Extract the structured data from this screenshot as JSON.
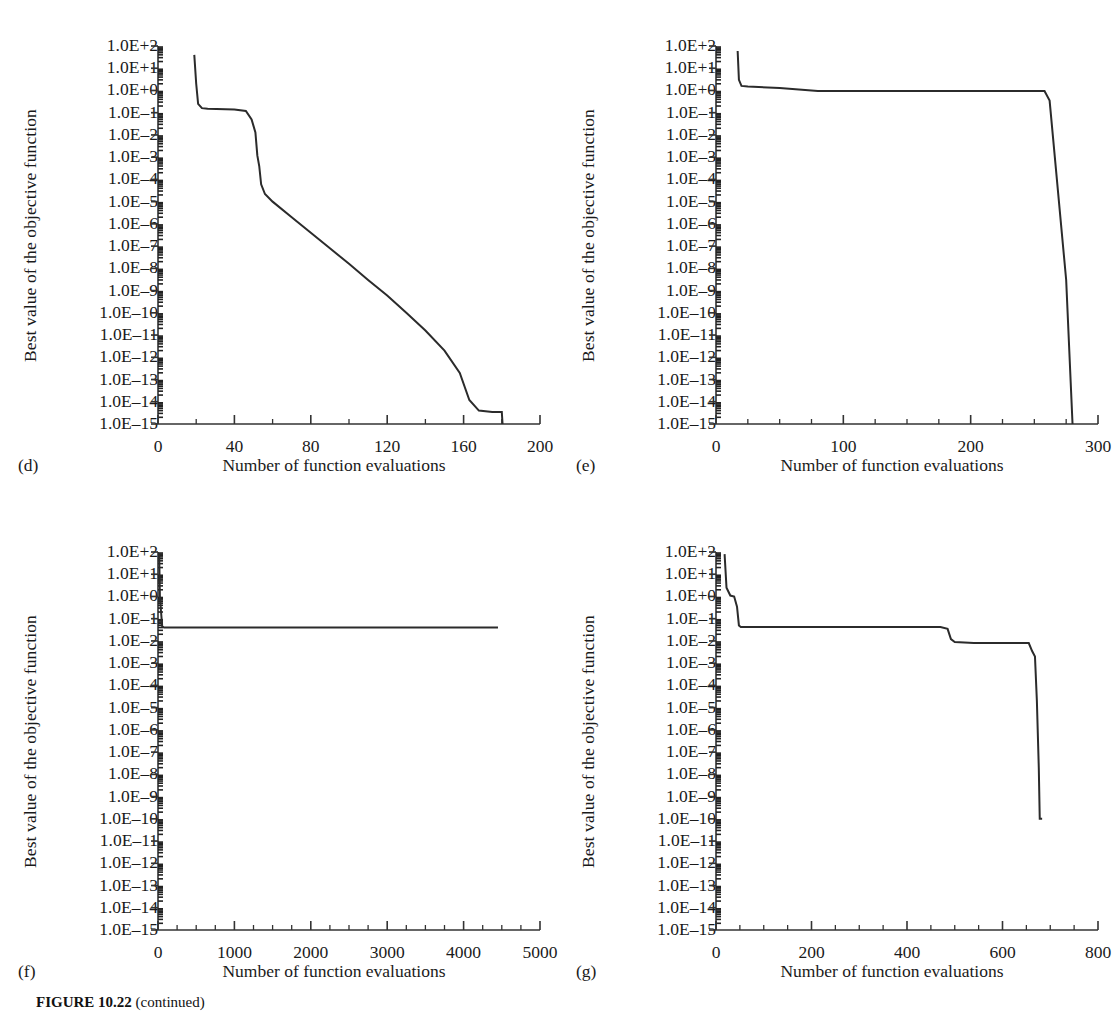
{
  "figure": {
    "caption_bold": "FIGURE 10.22",
    "caption_rest": " (continued)"
  },
  "common": {
    "ylabel": "Best value of the objective function",
    "xlabel": "Number of function evaluations",
    "ytick_labels": [
      "1.0E+2",
      "1.0E+1",
      "1.0E+0",
      "1.0E–1",
      "1.0E–2",
      "1.0E–3",
      "1.0E–4",
      "1.0E–5",
      "1.0E–6",
      "1.0E–7",
      "1.0E–8",
      "1.0E–9",
      "1.0E–10",
      "1.0E–11",
      "1.0E–12",
      "1.0E–13",
      "1.0E–14",
      "1.0E–15"
    ],
    "line_color": "#2b2b2b",
    "axis_color": "#333333"
  },
  "chart_data": [
    {
      "id": "d",
      "panel_tag": "(d)",
      "type": "line",
      "title": "",
      "xlabel": "Number of function evaluations",
      "ylabel": "Best value of the objective function",
      "yscale": "log",
      "ylim": [
        1e-15,
        100
      ],
      "ytick_values": [
        100,
        10,
        1,
        0.1,
        0.01,
        0.001,
        0.0001,
        1e-05,
        1e-06,
        1e-07,
        1e-08,
        1e-09,
        1e-10,
        1e-11,
        1e-12,
        1e-13,
        1e-14,
        1e-15
      ],
      "xlim": [
        0,
        200
      ],
      "xticks": [
        0,
        40,
        80,
        120,
        160,
        200
      ],
      "xtick_labels": [
        "0",
        "40",
        "80",
        "120",
        "160",
        "200"
      ],
      "x_minor_step": 20,
      "grid": false,
      "legend": null,
      "points": [
        [
          19,
          40
        ],
        [
          20,
          2.0
        ],
        [
          21,
          0.25
        ],
        [
          23,
          0.16
        ],
        [
          26,
          0.15
        ],
        [
          40,
          0.14
        ],
        [
          46,
          0.12
        ],
        [
          49,
          0.05
        ],
        [
          51,
          0.013
        ],
        [
          52,
          0.0012
        ],
        [
          53,
          0.0004
        ],
        [
          54,
          6e-05
        ],
        [
          56,
          2.2e-05
        ],
        [
          60,
          1e-05
        ],
        [
          70,
          2e-06
        ],
        [
          80,
          4e-07
        ],
        [
          90,
          8e-08
        ],
        [
          100,
          1.6e-08
        ],
        [
          110,
          3e-09
        ],
        [
          120,
          6e-10
        ],
        [
          130,
          1e-10
        ],
        [
          140,
          1.6e-11
        ],
        [
          150,
          2e-12
        ],
        [
          158,
          2e-13
        ],
        [
          163,
          1.2e-14
        ],
        [
          168,
          4e-15
        ],
        [
          175,
          3.5e-15
        ],
        [
          180,
          3.5e-15
        ],
        [
          180.4,
          1e-15
        ]
      ]
    },
    {
      "id": "e",
      "panel_tag": "(e)",
      "type": "line",
      "title": "",
      "xlabel": "Number of function evaluations",
      "ylabel": "Best value of the objective function",
      "yscale": "log",
      "ylim": [
        1e-15,
        100
      ],
      "ytick_values": [
        100,
        10,
        1,
        0.1,
        0.01,
        0.001,
        0.0001,
        1e-05,
        1e-06,
        1e-07,
        1e-08,
        1e-09,
        1e-10,
        1e-11,
        1e-12,
        1e-13,
        1e-14,
        1e-15
      ],
      "xlim": [
        0,
        300
      ],
      "xticks": [
        0,
        100,
        200,
        300
      ],
      "xtick_labels": [
        "0",
        "100",
        "200",
        "300"
      ],
      "x_minor_step": 25,
      "grid": false,
      "legend": null,
      "points": [
        [
          17,
          60
        ],
        [
          18,
          3.0
        ],
        [
          20,
          1.6
        ],
        [
          25,
          1.5
        ],
        [
          50,
          1.3
        ],
        [
          70,
          1.05
        ],
        [
          80,
          0.95
        ],
        [
          120,
          0.95
        ],
        [
          180,
          0.95
        ],
        [
          240,
          0.95
        ],
        [
          258,
          0.95
        ],
        [
          262,
          0.35
        ],
        [
          275,
          3e-09
        ],
        [
          280,
          1e-15
        ]
      ]
    },
    {
      "id": "f",
      "panel_tag": "(f)",
      "type": "line",
      "title": "",
      "xlabel": "Number of function evaluations",
      "ylabel": "Best value of the objective function",
      "yscale": "log",
      "ylim": [
        1e-15,
        100
      ],
      "ytick_values": [
        100,
        10,
        1,
        0.1,
        0.01,
        0.001,
        0.0001,
        1e-05,
        1e-06,
        1e-07,
        1e-08,
        1e-09,
        1e-10,
        1e-11,
        1e-12,
        1e-13,
        1e-14,
        1e-15
      ],
      "xlim": [
        0,
        5000
      ],
      "xticks": [
        0,
        1000,
        2000,
        3000,
        4000,
        5000
      ],
      "xtick_labels": [
        "0",
        "1000",
        "2000",
        "3000",
        "4000",
        "5000"
      ],
      "x_minor_step": 250,
      "grid": false,
      "legend": null,
      "points": [
        [
          15,
          90
        ],
        [
          25,
          1.0
        ],
        [
          40,
          0.2
        ],
        [
          55,
          0.045
        ],
        [
          80,
          0.04
        ],
        [
          400,
          0.04
        ],
        [
          1000,
          0.04
        ],
        [
          2000,
          0.04
        ],
        [
          3000,
          0.04
        ],
        [
          4000,
          0.04
        ],
        [
          4450,
          0.04
        ]
      ]
    },
    {
      "id": "g",
      "panel_tag": "(g)",
      "type": "line",
      "title": "",
      "xlabel": "Number of function evaluations",
      "ylabel": "Best value of the objective function",
      "yscale": "log",
      "ylim": [
        1e-15,
        100
      ],
      "ytick_values": [
        100,
        10,
        1,
        0.1,
        0.01,
        0.001,
        0.0001,
        1e-05,
        1e-06,
        1e-07,
        1e-08,
        1e-09,
        1e-10,
        1e-11,
        1e-12,
        1e-13,
        1e-14,
        1e-15
      ],
      "xlim": [
        0,
        800
      ],
      "xticks": [
        0,
        200,
        400,
        600,
        800
      ],
      "xtick_labels": [
        "0",
        "200",
        "400",
        "600",
        "800"
      ],
      "x_minor_step": 50,
      "grid": false,
      "legend": null,
      "points": [
        [
          18,
          80
        ],
        [
          22,
          2.5
        ],
        [
          30,
          1.1
        ],
        [
          38,
          1.0
        ],
        [
          44,
          0.35
        ],
        [
          48,
          0.05
        ],
        [
          52,
          0.042
        ],
        [
          100,
          0.042
        ],
        [
          200,
          0.042
        ],
        [
          300,
          0.042
        ],
        [
          400,
          0.042
        ],
        [
          470,
          0.042
        ],
        [
          485,
          0.035
        ],
        [
          492,
          0.012
        ],
        [
          500,
          0.009
        ],
        [
          540,
          0.008
        ],
        [
          600,
          0.008
        ],
        [
          655,
          0.008
        ],
        [
          662,
          0.0035
        ],
        [
          668,
          0.002
        ],
        [
          672,
          2e-05
        ],
        [
          676,
          2e-08
        ],
        [
          678,
          1e-10
        ],
        [
          683,
          1e-10
        ]
      ]
    }
  ]
}
